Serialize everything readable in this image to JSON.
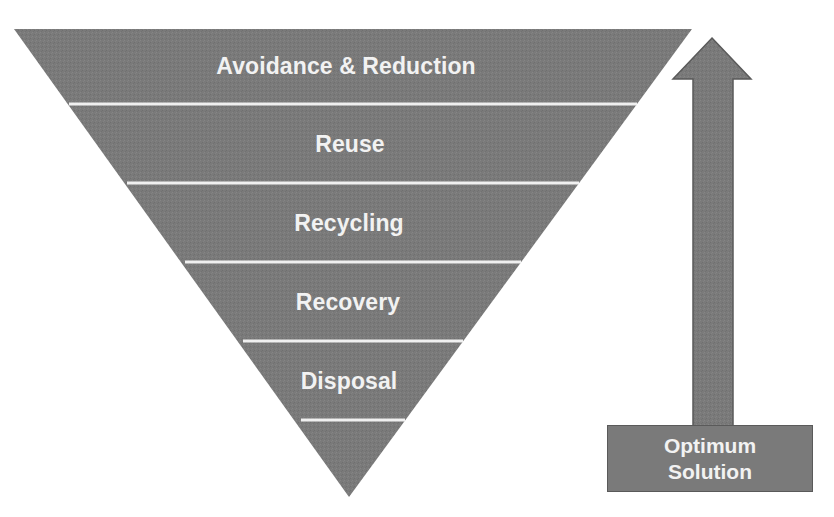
{
  "diagram": {
    "type": "inverted-pyramid-hierarchy",
    "title": "",
    "colors": {
      "fill": "#7a7a7a",
      "separator": "#f0f0f0",
      "text": "#f2f2f2",
      "arrow_fill": "#808080",
      "arrow_stroke": "#5a5a5a",
      "background": "#ffffff"
    },
    "tiers": [
      {
        "label": "Avoidance & Reduction"
      },
      {
        "label": "Reuse"
      },
      {
        "label": "Recycling"
      },
      {
        "label": "Recovery"
      },
      {
        "label": "Disposal"
      },
      {
        "label": ""
      }
    ],
    "arrow": {
      "direction": "up",
      "label_line1": "Optimum",
      "label_line2": "Solution"
    }
  }
}
